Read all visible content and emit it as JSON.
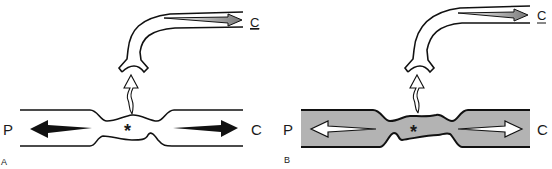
{
  "panels": [
    {
      "id": "A",
      "panel_label": "A",
      "left_label": "P",
      "right_label": "C",
      "tube_label": "C",
      "center_marker": "*",
      "vessel_fill": "none",
      "arrow_fill": "#111111"
    },
    {
      "id": "B",
      "panel_label": "B",
      "left_label": "P",
      "right_label": "C",
      "tube_label": "C",
      "center_marker": "*",
      "vessel_fill": "#b3b3b3",
      "arrow_fill": "#ffffff"
    }
  ],
  "colors": {
    "stroke": "#111111",
    "gray_fill": "#b3b3b3",
    "tube_arrow": "#8a8a8a"
  }
}
